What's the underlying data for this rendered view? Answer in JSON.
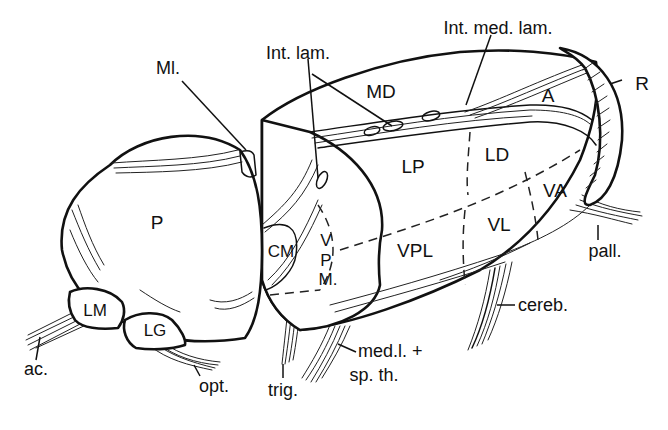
{
  "figure": {
    "stroke_color": "#111111",
    "background": "#ffffff"
  },
  "nuclei": {
    "P": "P",
    "LM": "LM",
    "LG": "LG",
    "CM": "CM",
    "VPM_V": "V",
    "VPM_P": "P",
    "VPM_M": "M.",
    "MD": "MD",
    "A": "A",
    "LP": "LP",
    "LD": "LD",
    "VA": "VA",
    "VL": "VL",
    "VPL": "VPL",
    "R": "R"
  },
  "callouts": {
    "ml": "Ml.",
    "int_lam": "Int. lam.",
    "int_med_lam": "Int. med. lam.",
    "pall": "pall.",
    "cereb": "cereb.",
    "med_l_1": "med.l. +",
    "med_l_2": "sp. th.",
    "trig": "trig.",
    "opt": "opt.",
    "ac": "ac."
  }
}
